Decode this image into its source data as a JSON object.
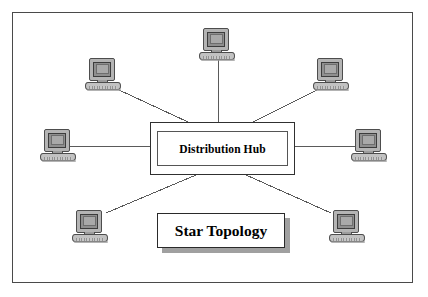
{
  "diagram": {
    "title": "Star Topology",
    "hub_label": "Distribution Hub",
    "frame": {
      "x": 12,
      "y": 12,
      "width": 401,
      "height": 271
    },
    "colors": {
      "background": "#ffffff",
      "frame_border": "#4a4a4a",
      "line": "#5a5a5a",
      "box_border": "#303030",
      "shadow": "#a0a0a0",
      "monitor_body": "#b4b4b4",
      "screen": "#a9a9a9",
      "keyboard": "#c2c2c2",
      "text": "#000000"
    },
    "hub": {
      "name": "Distribution Hub",
      "x": 150,
      "y": 122,
      "width": 145,
      "height": 53,
      "style": "double-bordered-rectangle"
    },
    "caption": {
      "text": "Star Topology",
      "x": 157,
      "y": 213,
      "width": 128,
      "height": 35,
      "shadow_offset": 5
    },
    "nodes": [
      {
        "id": "node-top",
        "label": "computer-workstation",
        "x": 199,
        "y": 28,
        "icon": "desktop-computer-icon"
      },
      {
        "id": "node-top-left",
        "label": "computer-workstation",
        "x": 85,
        "y": 58,
        "icon": "desktop-computer-icon"
      },
      {
        "id": "node-top-right",
        "label": "computer-workstation",
        "x": 313,
        "y": 58,
        "icon": "desktop-computer-icon"
      },
      {
        "id": "node-left",
        "label": "computer-workstation",
        "x": 40,
        "y": 129,
        "icon": "desktop-computer-icon"
      },
      {
        "id": "node-right",
        "label": "computer-workstation",
        "x": 351,
        "y": 129,
        "icon": "desktop-computer-icon"
      },
      {
        "id": "node-bottom-left",
        "label": "computer-workstation",
        "x": 72,
        "y": 210,
        "icon": "desktop-computer-icon"
      },
      {
        "id": "node-bottom-right",
        "label": "computer-workstation",
        "x": 329,
        "y": 210,
        "icon": "desktop-computer-icon"
      }
    ],
    "links": [
      {
        "from": "node-top",
        "to": "hub",
        "x1": 218,
        "y1": 60,
        "x2": 218,
        "y2": 122
      },
      {
        "from": "node-top-left",
        "to": "hub",
        "x1": 119,
        "y1": 90,
        "x2": 188,
        "y2": 122
      },
      {
        "from": "node-top-right",
        "to": "hub",
        "x1": 317,
        "y1": 90,
        "x2": 253,
        "y2": 122
      },
      {
        "from": "node-left",
        "to": "hub",
        "x1": 70,
        "y1": 146,
        "x2": 150,
        "y2": 146
      },
      {
        "from": "node-right",
        "to": "hub",
        "x1": 295,
        "y1": 146,
        "x2": 355,
        "y2": 146
      },
      {
        "from": "node-bottom-left",
        "to": "hub",
        "x1": 106,
        "y1": 213,
        "x2": 196,
        "y2": 175
      },
      {
        "from": "node-bottom-right",
        "to": "hub",
        "x1": 331,
        "y1": 213,
        "x2": 246,
        "y2": 175
      }
    ]
  }
}
